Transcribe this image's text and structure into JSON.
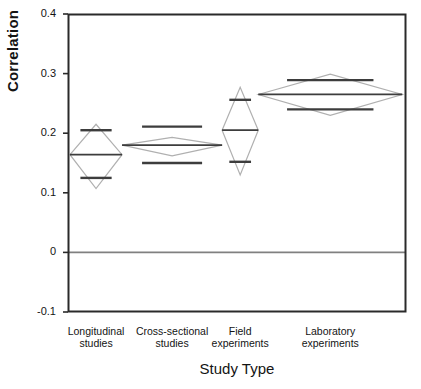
{
  "chart_data": {
    "type": "scatter",
    "plot_style": "means-diamonds",
    "title": "",
    "xlabel": "Study Type",
    "ylabel": "Correlation",
    "ylim": [
      -0.1,
      0.4
    ],
    "yticks": [
      0.4,
      0.3,
      0.2,
      0.1,
      0,
      -0.1
    ],
    "ytick_labels": [
      "0.4",
      "0.3",
      "0.2",
      "0.1",
      "0",
      "-0.1"
    ],
    "grid": false,
    "legend": "none",
    "reference_line": {
      "value": 0,
      "label": "0",
      "color": "#808080"
    },
    "categories": [
      "Longitudinal studies",
      "Cross-sectional studies",
      "Field experiments",
      "Laboratory experiments"
    ],
    "category_lines": [
      [
        "Longitudinal",
        "studies"
      ],
      [
        "Cross-sectional",
        "studies"
      ],
      [
        "Field",
        "experiments"
      ],
      [
        "Laboratory",
        "experiments"
      ]
    ],
    "series": [
      {
        "name": "mean",
        "values": [
          0.164,
          0.18,
          0.205,
          0.265
        ]
      },
      {
        "name": "ci_upper",
        "values": [
          0.215,
          0.193,
          0.277,
          0.299
        ]
      },
      {
        "name": "ci_lower",
        "values": [
          0.107,
          0.162,
          0.13,
          0.23
        ]
      },
      {
        "name": "overlap_upper",
        "values": [
          0.205,
          0.211,
          0.256,
          0.289
        ]
      },
      {
        "name": "overlap_lower",
        "values": [
          0.125,
          0.15,
          0.152,
          0.24
        ]
      }
    ],
    "group_widths_fraction": [
      0.154,
      0.296,
      0.107,
      0.426
    ],
    "diamond_color": "#b0b0b0",
    "mean_line_color": "#3d3d3d",
    "axis_color": "#2a2a2a",
    "background": "#ffffff"
  },
  "axis": {
    "y_title": "Correlation",
    "x_title": "Study Type"
  }
}
